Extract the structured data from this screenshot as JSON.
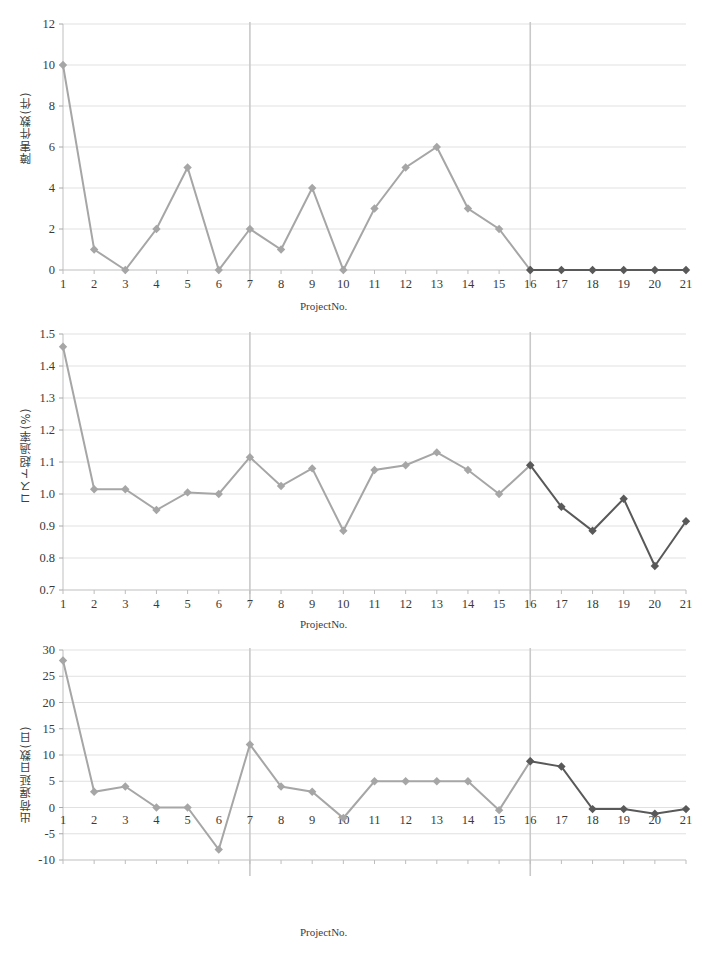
{
  "figure": {
    "background": "#ffffff",
    "series_early_color": "#a6a6a6",
    "series_late_color": "#595959",
    "gridline_color": "#d9d9d9",
    "axis_color": "#bfbfbf",
    "marker_shape": "diamond",
    "xaxis_title": "ProjectNo.",
    "bottom_caption": ""
  },
  "charts": [
    {
      "id": "chart1",
      "ylabel": "障害件数(件)",
      "xlabel": "ProjectNo.",
      "separators": [
        7,
        16
      ]
    },
    {
      "id": "chart2",
      "ylabel": "コスト超過率(%)",
      "xlabel": "ProjectNo.",
      "separators": [
        7,
        16
      ]
    },
    {
      "id": "chart3",
      "ylabel": "出荷遅延日数(日)",
      "xlabel": "ProjectNo.",
      "separators": [
        7,
        16
      ]
    }
  ],
  "chart_data": [
    {
      "type": "line",
      "title": "",
      "xlabel": "ProjectNo.",
      "ylabel": "障害件数(件)",
      "x": [
        1,
        2,
        3,
        4,
        5,
        6,
        7,
        8,
        9,
        10,
        11,
        12,
        13,
        14,
        15,
        16,
        17,
        18,
        19,
        20,
        21
      ],
      "categories": [
        "1",
        "2",
        "3",
        "4",
        "5",
        "6",
        "7",
        "8",
        "9",
        "10",
        "11",
        "12",
        "13",
        "14",
        "15",
        "16",
        "17",
        "18",
        "19",
        "20",
        "21"
      ],
      "values": [
        10,
        1,
        0,
        2,
        5,
        0,
        2,
        1,
        4,
        0,
        3,
        5,
        6,
        3,
        2,
        0,
        0,
        0,
        0,
        0,
        0
      ],
      "series": [
        {
          "name": "ProjectNo. 1-16",
          "color": "#a6a6a6",
          "x": [
            1,
            2,
            3,
            4,
            5,
            6,
            7,
            8,
            9,
            10,
            11,
            12,
            13,
            14,
            15,
            16
          ],
          "values": [
            10,
            1,
            0,
            2,
            5,
            0,
            2,
            1,
            4,
            0,
            3,
            5,
            6,
            3,
            2,
            0
          ]
        },
        {
          "name": "ProjectNo. 16-21",
          "color": "#595959",
          "x": [
            16,
            17,
            18,
            19,
            20,
            21
          ],
          "values": [
            0,
            0,
            0,
            0,
            0,
            0
          ]
        }
      ],
      "ylim": [
        0,
        12
      ],
      "yticks": [
        0,
        2,
        4,
        6,
        8,
        10,
        12
      ],
      "ytick_labels": [
        "0",
        "2",
        "4",
        "6",
        "8",
        "10",
        "12"
      ],
      "xtick_labels": [
        "1",
        "2",
        "3",
        "4",
        "5",
        "6",
        "7",
        "8",
        "9",
        "10",
        "11",
        "12",
        "13",
        "14",
        "15",
        "16",
        "17",
        "18",
        "19",
        "20",
        "21"
      ],
      "grid": true,
      "legend": "none",
      "annotations": [
        {
          "type": "vline",
          "x": 7,
          "color": "#c9c9c9"
        },
        {
          "type": "vline",
          "x": 16,
          "color": "#c9c9c9"
        }
      ]
    },
    {
      "type": "line",
      "title": "",
      "xlabel": "ProjectNo.",
      "ylabel": "コスト超過率(%)",
      "x": [
        1,
        2,
        3,
        4,
        5,
        6,
        7,
        8,
        9,
        10,
        11,
        12,
        13,
        14,
        15,
        16,
        17,
        18,
        19,
        20,
        21
      ],
      "categories": [
        "1",
        "2",
        "3",
        "4",
        "5",
        "6",
        "7",
        "8",
        "9",
        "10",
        "11",
        "12",
        "13",
        "14",
        "15",
        "16",
        "17",
        "18",
        "19",
        "20",
        "21"
      ],
      "values": [
        1.46,
        1.015,
        1.015,
        0.95,
        1.005,
        1.0,
        1.115,
        1.025,
        1.08,
        0.885,
        1.075,
        1.09,
        1.13,
        1.075,
        1.0,
        1.09,
        0.96,
        0.885,
        0.985,
        0.775,
        0.915
      ],
      "series": [
        {
          "name": "ProjectNo. 1-16",
          "color": "#a6a6a6",
          "x": [
            1,
            2,
            3,
            4,
            5,
            6,
            7,
            8,
            9,
            10,
            11,
            12,
            13,
            14,
            15,
            16
          ],
          "values": [
            1.46,
            1.015,
            1.015,
            0.95,
            1.005,
            1.0,
            1.115,
            1.025,
            1.08,
            0.885,
            1.075,
            1.09,
            1.13,
            1.075,
            1.0,
            1.09
          ]
        },
        {
          "name": "ProjectNo. 16-21",
          "color": "#595959",
          "x": [
            16,
            17,
            18,
            19,
            20,
            21
          ],
          "values": [
            1.09,
            0.96,
            0.885,
            0.985,
            0.775,
            0.915
          ]
        }
      ],
      "ylim": [
        0.7,
        1.5
      ],
      "yticks": [
        0.7,
        0.8,
        0.9,
        1.0,
        1.1,
        1.2,
        1.3,
        1.4,
        1.5
      ],
      "ytick_labels": [
        "0.7",
        "0.8",
        "0.9",
        "1.0",
        "1.1",
        "1.2",
        "1.3",
        "1.4",
        "1.5"
      ],
      "xtick_labels": [
        "1",
        "2",
        "3",
        "4",
        "5",
        "6",
        "7",
        "8",
        "9",
        "10",
        "11",
        "12",
        "13",
        "14",
        "15",
        "16",
        "17",
        "18",
        "19",
        "20",
        "21"
      ],
      "grid": true,
      "legend": "none",
      "annotations": [
        {
          "type": "vline",
          "x": 7,
          "color": "#c9c9c9"
        },
        {
          "type": "vline",
          "x": 16,
          "color": "#c9c9c9"
        }
      ]
    },
    {
      "type": "line",
      "title": "",
      "xlabel": "ProjectNo.",
      "ylabel": "出荷遅延日数(日)",
      "x": [
        1,
        2,
        3,
        4,
        5,
        6,
        7,
        8,
        9,
        10,
        11,
        12,
        13,
        14,
        15,
        16,
        17,
        18,
        19,
        20,
        21
      ],
      "categories": [
        "1",
        "2",
        "3",
        "4",
        "5",
        "6",
        "7",
        "8",
        "9",
        "10",
        "11",
        "12",
        "13",
        "14",
        "15",
        "16",
        "17",
        "18",
        "19",
        "20",
        "21"
      ],
      "values": [
        28,
        3,
        4,
        0,
        0,
        -8,
        12,
        4,
        3,
        -2,
        5,
        5,
        5,
        5,
        -0.5,
        8.8,
        7.8,
        -0.3,
        -0.3,
        -1.2,
        -0.3
      ],
      "series": [
        {
          "name": "ProjectNo. 1-16",
          "color": "#a6a6a6",
          "x": [
            1,
            2,
            3,
            4,
            5,
            6,
            7,
            8,
            9,
            10,
            11,
            12,
            13,
            14,
            15,
            16
          ],
          "values": [
            28,
            3,
            4,
            0,
            0,
            -8,
            12,
            4,
            3,
            -2,
            5,
            5,
            5,
            5,
            -0.5,
            8.8
          ]
        },
        {
          "name": "ProjectNo. 16-21",
          "color": "#595959",
          "x": [
            16,
            17,
            18,
            19,
            20,
            21
          ],
          "values": [
            8.8,
            7.8,
            -0.3,
            -0.3,
            -1.2,
            -0.3
          ]
        }
      ],
      "ylim": [
        -10,
        30
      ],
      "yticks": [
        -10,
        -5,
        0,
        5,
        10,
        15,
        20,
        25,
        30
      ],
      "ytick_labels": [
        "-10",
        "-5",
        "0",
        "5",
        "10",
        "15",
        "20",
        "25",
        "30"
      ],
      "xtick_labels": [
        "1",
        "2",
        "3",
        "4",
        "5",
        "6",
        "7",
        "8",
        "9",
        "10",
        "11",
        "12",
        "13",
        "14",
        "15",
        "16",
        "17",
        "18",
        "19",
        "20",
        "21"
      ],
      "grid": true,
      "legend": "none",
      "annotations": [
        {
          "type": "vline",
          "x": 7,
          "color": "#c9c9c9"
        },
        {
          "type": "vline",
          "x": 16,
          "color": "#c9c9c9"
        }
      ]
    }
  ]
}
